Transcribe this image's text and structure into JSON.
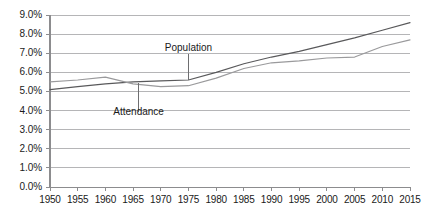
{
  "chart_data": {
    "type": "line",
    "title": "",
    "xlabel": "",
    "ylabel": "",
    "x": [
      1950,
      1955,
      1960,
      1965,
      1970,
      1975,
      1980,
      1985,
      1990,
      1995,
      2000,
      2005,
      2010,
      2015
    ],
    "xlim": [
      1950,
      2015
    ],
    "ylim": [
      0.0,
      9.0
    ],
    "ytick_labels": [
      "9.0%",
      "8.0%",
      "7.0%",
      "6.0%",
      "5.0%",
      "4.0%",
      "3.0%",
      "2.0%",
      "1.0%",
      "0.0%"
    ],
    "ytick_values": [
      9.0,
      8.0,
      7.0,
      6.0,
      5.0,
      4.0,
      3.0,
      2.0,
      1.0,
      0.0
    ],
    "xtick_labels": [
      "1950",
      "1955",
      "1960",
      "1965",
      "1970",
      "1975",
      "1980",
      "1985",
      "1990",
      "1995",
      "2000",
      "2005",
      "2010",
      "2015"
    ],
    "grid": "horizontal",
    "legend": "none",
    "series": [
      {
        "name": "Population",
        "color": "#59595b",
        "values": [
          5.1,
          5.25,
          5.4,
          5.5,
          5.55,
          5.6,
          6.0,
          6.45,
          6.8,
          7.1,
          7.45,
          7.8,
          8.2,
          8.6
        ]
      },
      {
        "name": "Attendance",
        "color": "#9a9a9c",
        "values": [
          5.5,
          5.6,
          5.75,
          5.4,
          5.25,
          5.3,
          5.7,
          6.2,
          6.5,
          6.6,
          6.75,
          6.8,
          7.35,
          7.7
        ]
      }
    ],
    "annotations": [
      {
        "label": "Population",
        "target_x": 1975,
        "target_y": 5.6,
        "label_x": 1975,
        "label_y": 7.25
      },
      {
        "label": "Attendance",
        "target_x": 1966,
        "target_y": 5.45,
        "label_x": 1966,
        "label_y": 3.9
      }
    ],
    "axis_color": "#8c8c8e",
    "grid_color": "#b5b5b7",
    "text_color": "#1a1a1a"
  }
}
